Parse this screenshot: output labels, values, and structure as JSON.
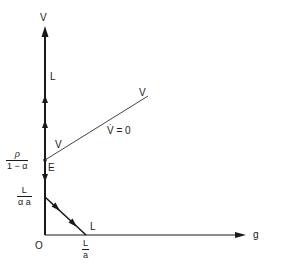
{
  "diagram": {
    "axes": {
      "y_label": "V",
      "x_label": "g",
      "origin_label": "O"
    },
    "points": {
      "equilibrium_label": "E"
    },
    "labels": {
      "vertical_path_label": "L",
      "isocline_start_label": "V",
      "isocline_end_label": "V",
      "isocline_equation": "V̇ = 0",
      "diagonal_path_label": "L"
    },
    "y_ticks": {
      "rho_over": {
        "num": "ρ",
        "den": "1 − α"
      },
      "L_over_alpha_a": {
        "num": "L",
        "den": "α a"
      }
    },
    "x_ticks": {
      "L_over_a": {
        "num": "L",
        "den": "a"
      }
    },
    "colors": {
      "line": "#1a1a1a",
      "isocline": "#444444",
      "background": "#ffffff"
    }
  }
}
